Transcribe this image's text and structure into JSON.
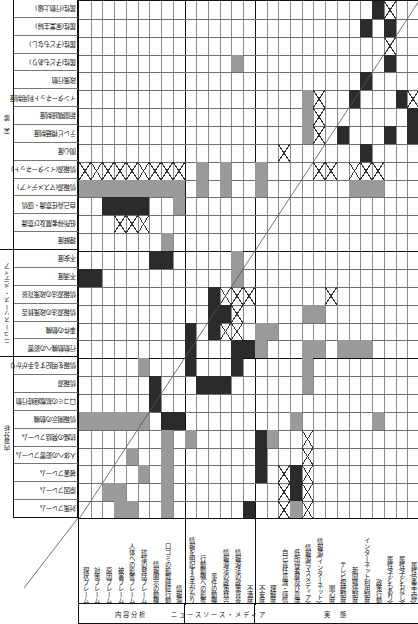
{
  "figure": {
    "type": "design-structure-matrix",
    "rows_count": 29,
    "cols_count": 29,
    "legend": {
      "dark_color": "#2b2b2b",
      "mid_color": "#9a9a9a",
      "cross_color": "#333333",
      "grid_color": "#8b8b8b",
      "border_color": "#111111"
    }
  },
  "row_groups": [
    {
      "label": "実　態",
      "start": 0,
      "end": 14
    },
    {
      "label": "ニュースソース・メディア",
      "start": 14,
      "end": 20
    },
    {
      "label": "内容分析",
      "start": 20,
      "end": 29
    }
  ],
  "col_groups": [
    {
      "label": "内容分析",
      "start": 0,
      "end": 9
    },
    {
      "label": "ニュースソース・メディア",
      "start": 9,
      "end": 15
    },
    {
      "label": "実　態",
      "start": 15,
      "end": 29
    }
  ],
  "row_labels": [
    "属性(行動上級)",
    "属性(家業主婦)",
    "属性(子どもなし)",
    "属性(子どもあり)",
    "政策行動",
    "インターネット利用制度",
    "新聞購読制度",
    "テレビ視聴制度",
    "関心度",
    "情報源(インターネット)",
    "情報源(マスメディア)",
    "自己責任意識・感情",
    "低所得者層及び意識",
    "理解度",
    "不安度",
    "不満度",
    "情報源法の政策背景",
    "情報源法の政策賛否",
    "事件の動機",
    "行動動機への影響",
    "情報を明記する手がかり",
    "情報源",
    "口コミの拡散経緯行動",
    "情報開示の動機",
    "抗議の発話フレーム",
    "人体への影響フレーム",
    "被害フレーム",
    "原因フレーム",
    "対策フレーム",
    "現状フレーム"
  ],
  "col_labels": [
    "現状フレーム",
    "対策フレーム",
    "原因フレーム",
    "被害フレーム",
    "人体への影響フレーム",
    "抗議の発話フレーム",
    "情報開示の動機",
    "口コミの拡散経緯行動",
    "情報源",
    "情報を明記する手がかり",
    "行動動機への影響",
    "事件の動機",
    "情報源法の政策賛否",
    "情報源法の政策背景",
    "不満度",
    "不安度",
    "理解度",
    "自己責任意識・感情",
    "低所得者層及び意識",
    "情報源(マスメディア)",
    "情報源(インターネット)",
    "関心度",
    "テレビ視聴制度",
    "新聞購読制度",
    "インターネット利用制度",
    "政策行動",
    "属性(子どもあり)",
    "属性(子どもなし)",
    "属性(家業主婦)"
  ],
  "cells": [
    {
      "r": 0,
      "c": 25,
      "v": "dark"
    },
    {
      "r": 0,
      "c": 26,
      "v": "x"
    },
    {
      "r": 1,
      "c": 24,
      "v": "dark"
    },
    {
      "r": 1,
      "c": 26,
      "v": "dark"
    },
    {
      "r": 2,
      "c": 26,
      "v": "x"
    },
    {
      "r": 3,
      "c": 13,
      "v": "mid"
    },
    {
      "r": 3,
      "c": 26,
      "v": "dark"
    },
    {
      "r": 4,
      "c": 24,
      "v": "dark"
    },
    {
      "r": 5,
      "c": 19,
      "v": "mid"
    },
    {
      "r": 5,
      "c": 20,
      "v": "x"
    },
    {
      "r": 5,
      "c": 23,
      "v": "dark"
    },
    {
      "r": 5,
      "c": 27,
      "v": "dark"
    },
    {
      "r": 5,
      "c": 28,
      "v": "x"
    },
    {
      "r": 6,
      "c": 19,
      "v": "mid"
    },
    {
      "r": 6,
      "c": 20,
      "v": "x"
    },
    {
      "r": 6,
      "c": 28,
      "v": "dark"
    },
    {
      "r": 7,
      "c": 19,
      "v": "mid"
    },
    {
      "r": 7,
      "c": 20,
      "v": "x"
    },
    {
      "r": 7,
      "c": 22,
      "v": "dark"
    },
    {
      "r": 7,
      "c": 26,
      "v": "dark"
    },
    {
      "r": 7,
      "c": 28,
      "v": "dark"
    },
    {
      "r": 8,
      "c": 17,
      "v": "x"
    },
    {
      "r": 8,
      "c": 24,
      "v": "dark"
    },
    {
      "r": 9,
      "c": 0,
      "v": "x"
    },
    {
      "r": 9,
      "c": 1,
      "v": "x"
    },
    {
      "r": 9,
      "c": 2,
      "v": "x"
    },
    {
      "r": 9,
      "c": 3,
      "v": "x"
    },
    {
      "r": 9,
      "c": 4,
      "v": "x"
    },
    {
      "r": 9,
      "c": 5,
      "v": "x"
    },
    {
      "r": 9,
      "c": 6,
      "v": "x"
    },
    {
      "r": 9,
      "c": 7,
      "v": "x"
    },
    {
      "r": 9,
      "c": 8,
      "v": "x"
    },
    {
      "r": 9,
      "c": 10,
      "v": "mid"
    },
    {
      "r": 9,
      "c": 12,
      "v": "mid"
    },
    {
      "r": 9,
      "c": 15,
      "v": "mid"
    },
    {
      "r": 9,
      "c": 20,
      "v": "x"
    },
    {
      "r": 9,
      "c": 21,
      "v": "x"
    },
    {
      "r": 9,
      "c": 23,
      "v": "x"
    },
    {
      "r": 9,
      "c": 24,
      "v": "x"
    },
    {
      "r": 9,
      "c": 25,
      "v": "x"
    },
    {
      "r": 10,
      "c": 0,
      "v": "mid"
    },
    {
      "r": 10,
      "c": 1,
      "v": "mid"
    },
    {
      "r": 10,
      "c": 2,
      "v": "mid"
    },
    {
      "r": 10,
      "c": 3,
      "v": "mid"
    },
    {
      "r": 10,
      "c": 4,
      "v": "mid"
    },
    {
      "r": 10,
      "c": 5,
      "v": "mid"
    },
    {
      "r": 10,
      "c": 6,
      "v": "mid"
    },
    {
      "r": 10,
      "c": 7,
      "v": "mid"
    },
    {
      "r": 10,
      "c": 8,
      "v": "mid"
    },
    {
      "r": 10,
      "c": 10,
      "v": "mid"
    },
    {
      "r": 10,
      "c": 12,
      "v": "mid"
    },
    {
      "r": 10,
      "c": 15,
      "v": "mid"
    },
    {
      "r": 10,
      "c": 23,
      "v": "mid"
    },
    {
      "r": 10,
      "c": 24,
      "v": "mid"
    },
    {
      "r": 10,
      "c": 25,
      "v": "mid"
    },
    {
      "r": 11,
      "c": 2,
      "v": "dark"
    },
    {
      "r": 11,
      "c": 3,
      "v": "dark"
    },
    {
      "r": 11,
      "c": 4,
      "v": "dark"
    },
    {
      "r": 11,
      "c": 5,
      "v": "dark"
    },
    {
      "r": 11,
      "c": 8,
      "v": "mid"
    },
    {
      "r": 12,
      "c": 3,
      "v": "x"
    },
    {
      "r": 12,
      "c": 4,
      "v": "x"
    },
    {
      "r": 12,
      "c": 5,
      "v": "x"
    },
    {
      "r": 13,
      "c": 7,
      "v": "mid"
    },
    {
      "r": 14,
      "c": 6,
      "v": "dark"
    },
    {
      "r": 14,
      "c": 7,
      "v": "dark"
    },
    {
      "r": 14,
      "c": 13,
      "v": "mid"
    },
    {
      "r": 15,
      "c": 0,
      "v": "dark"
    },
    {
      "r": 15,
      "c": 1,
      "v": "dark"
    },
    {
      "r": 15,
      "c": 13,
      "v": "mid"
    },
    {
      "r": 16,
      "c": 11,
      "v": "dark"
    },
    {
      "r": 16,
      "c": 12,
      "v": "x"
    },
    {
      "r": 16,
      "c": 13,
      "v": "x"
    },
    {
      "r": 16,
      "c": 14,
      "v": "x"
    },
    {
      "r": 16,
      "c": 21,
      "v": "x"
    },
    {
      "r": 17,
      "c": 11,
      "v": "dark"
    },
    {
      "r": 17,
      "c": 12,
      "v": "dark"
    },
    {
      "r": 17,
      "c": 13,
      "v": "x"
    },
    {
      "r": 17,
      "c": 19,
      "v": "mid"
    },
    {
      "r": 17,
      "c": 20,
      "v": "mid"
    },
    {
      "r": 18,
      "c": 9,
      "v": "dark"
    },
    {
      "r": 18,
      "c": 11,
      "v": "dark"
    },
    {
      "r": 18,
      "c": 12,
      "v": "x"
    },
    {
      "r": 18,
      "c": 13,
      "v": "x"
    },
    {
      "r": 18,
      "c": 15,
      "v": "mid"
    },
    {
      "r": 18,
      "c": 16,
      "v": "mid"
    },
    {
      "r": 19,
      "c": 9,
      "v": "dark"
    },
    {
      "r": 19,
      "c": 13,
      "v": "dark"
    },
    {
      "r": 19,
      "c": 14,
      "v": "dark"
    },
    {
      "r": 19,
      "c": 15,
      "v": "mid"
    },
    {
      "r": 19,
      "c": 19,
      "v": "mid"
    },
    {
      "r": 19,
      "c": 20,
      "v": "mid"
    },
    {
      "r": 19,
      "c": 22,
      "v": "mid"
    },
    {
      "r": 19,
      "c": 23,
      "v": "mid"
    },
    {
      "r": 19,
      "c": 24,
      "v": "mid"
    },
    {
      "r": 20,
      "c": 5,
      "v": "mid"
    },
    {
      "r": 20,
      "c": 9,
      "v": "dark"
    },
    {
      "r": 20,
      "c": 13,
      "v": "dark"
    },
    {
      "r": 20,
      "c": 19,
      "v": "mid"
    },
    {
      "r": 21,
      "c": 6,
      "v": "dark"
    },
    {
      "r": 21,
      "c": 10,
      "v": "dark"
    },
    {
      "r": 21,
      "c": 11,
      "v": "dark"
    },
    {
      "r": 21,
      "c": 12,
      "v": "dark"
    },
    {
      "r": 21,
      "c": 19,
      "v": "mid"
    },
    {
      "r": 22,
      "c": 6,
      "v": "dark"
    },
    {
      "r": 23,
      "c": 0,
      "v": "mid"
    },
    {
      "r": 23,
      "c": 1,
      "v": "mid"
    },
    {
      "r": 23,
      "c": 2,
      "v": "mid"
    },
    {
      "r": 23,
      "c": 3,
      "v": "mid"
    },
    {
      "r": 23,
      "c": 4,
      "v": "mid"
    },
    {
      "r": 23,
      "c": 5,
      "v": "mid"
    },
    {
      "r": 23,
      "c": 7,
      "v": "dark"
    },
    {
      "r": 23,
      "c": 8,
      "v": "dark"
    },
    {
      "r": 23,
      "c": 18,
      "v": "mid"
    },
    {
      "r": 23,
      "c": 25,
      "v": "mid"
    },
    {
      "r": 24,
      "c": 7,
      "v": "mid"
    },
    {
      "r": 24,
      "c": 9,
      "v": "mid"
    },
    {
      "r": 24,
      "c": 15,
      "v": "dark"
    },
    {
      "r": 24,
      "c": 16,
      "v": "mid"
    },
    {
      "r": 24,
      "c": 19,
      "v": "x"
    },
    {
      "r": 25,
      "c": 4,
      "v": "mid"
    },
    {
      "r": 25,
      "c": 7,
      "v": "mid"
    },
    {
      "r": 25,
      "c": 15,
      "v": "dark"
    },
    {
      "r": 25,
      "c": 19,
      "v": "x"
    },
    {
      "r": 26,
      "c": 5,
      "v": "mid"
    },
    {
      "r": 26,
      "c": 7,
      "v": "mid"
    },
    {
      "r": 26,
      "c": 15,
      "v": "dark"
    },
    {
      "r": 26,
      "c": 17,
      "v": "x"
    },
    {
      "r": 26,
      "c": 18,
      "v": "dark"
    },
    {
      "r": 26,
      "c": 19,
      "v": "x"
    },
    {
      "r": 27,
      "c": 2,
      "v": "mid"
    },
    {
      "r": 27,
      "c": 3,
      "v": "mid"
    },
    {
      "r": 27,
      "c": 7,
      "v": "mid"
    },
    {
      "r": 27,
      "c": 17,
      "v": "x"
    },
    {
      "r": 27,
      "c": 18,
      "v": "dark"
    },
    {
      "r": 27,
      "c": 19,
      "v": "x"
    },
    {
      "r": 28,
      "c": 3,
      "v": "mid"
    },
    {
      "r": 28,
      "c": 4,
      "v": "mid"
    },
    {
      "r": 28,
      "c": 7,
      "v": "mid"
    },
    {
      "r": 28,
      "c": 14,
      "v": "dark"
    },
    {
      "r": 28,
      "c": 17,
      "v": "x"
    },
    {
      "r": 28,
      "c": 18,
      "v": "mid"
    },
    {
      "r": 28,
      "c": 19,
      "v": "x"
    }
  ]
}
